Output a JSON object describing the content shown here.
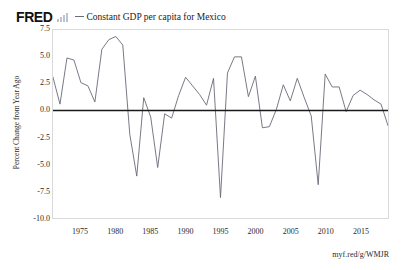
{
  "header": {
    "logo_text": "FRED",
    "logo_icon": "bar-chart-icon",
    "legend_label": "Constant GDP per capita for Mexico"
  },
  "footer": {
    "source_url": "myf.red/g/WMJR"
  },
  "colors": {
    "line": "#6a6a78",
    "zero_line": "#1a1a1a",
    "frame": "#d9d9d9",
    "text": "#2b2b2b",
    "background": "#ffffff"
  },
  "chart_data": {
    "type": "line",
    "title": "",
    "subtitle": "",
    "xlabel": "",
    "ylabel": "Percent Change from Year Ago",
    "legend": [
      "Constant GDP per capita for Mexico"
    ],
    "legend_position": "top",
    "grid": false,
    "zero_line": 0.0,
    "xlim": [
      1971,
      2019
    ],
    "ylim": [
      -10.0,
      7.5
    ],
    "y_ticks": [
      7.5,
      5.0,
      2.5,
      0.0,
      -2.5,
      -5.0,
      -7.5,
      -10.0
    ],
    "y_tick_labels": [
      "7.5",
      "5.0",
      "2.5",
      "0.0",
      "-2.5",
      "-5.0",
      "-7.5",
      "-10.0"
    ],
    "x_ticks": [
      1975,
      1980,
      1985,
      1990,
      1995,
      2000,
      2005,
      2010,
      2015
    ],
    "x_tick_labels": [
      "1975",
      "1980",
      "1985",
      "1990",
      "1995",
      "2000",
      "2005",
      "2010",
      "2015"
    ],
    "series": [
      {
        "name": "Constant GDP per capita for Mexico",
        "color": "#6a6a78",
        "x": [
          1971,
          1972,
          1973,
          1974,
          1975,
          1976,
          1977,
          1978,
          1979,
          1980,
          1981,
          1982,
          1983,
          1984,
          1985,
          1986,
          1987,
          1988,
          1989,
          1990,
          1991,
          1992,
          1993,
          1994,
          1995,
          1996,
          1997,
          1998,
          1999,
          2000,
          2001,
          2002,
          2003,
          2004,
          2005,
          2006,
          2007,
          2008,
          2009,
          2010,
          2011,
          2012,
          2013,
          2014,
          2015,
          2016,
          2017,
          2018,
          2019
        ],
        "values": [
          3.1,
          0.6,
          4.9,
          4.7,
          2.6,
          2.3,
          0.8,
          5.7,
          6.6,
          6.9,
          6.1,
          -2.2,
          -6.1,
          1.2,
          -0.6,
          -5.3,
          -0.3,
          -0.7,
          1.4,
          3.1,
          2.3,
          1.5,
          0.5,
          3.0,
          -8.1,
          3.5,
          5.0,
          5.0,
          1.3,
          3.2,
          -1.6,
          -1.5,
          0.1,
          2.4,
          0.9,
          3.0,
          1.2,
          -0.5,
          -6.9,
          3.4,
          2.2,
          2.2,
          -0.1,
          1.4,
          1.9,
          1.5,
          1.0,
          0.6,
          -1.4
        ]
      }
    ]
  }
}
